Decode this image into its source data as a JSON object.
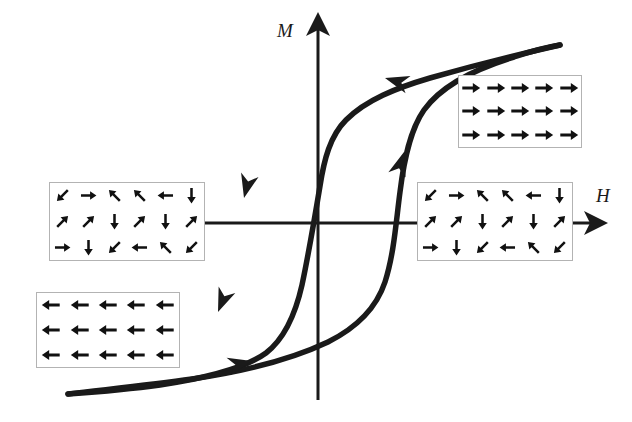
{
  "figure": {
    "type": "hysteresis-loop",
    "background_color": "#ffffff",
    "curve_color": "#1a1a1a",
    "axis_color": "#1a1a1a",
    "box_border_color": "#b3b3b3"
  },
  "axes": {
    "vertical": {
      "label": "M",
      "name": "magnetization-axis",
      "arrow_head": "up",
      "origin_x": 318,
      "top_y": 24,
      "bottom_y": 400
    },
    "horizontal": {
      "label": "H",
      "name": "field-axis",
      "arrow_head": "right",
      "origin_y": 223,
      "left_x": 146,
      "right_x": 596
    }
  },
  "chart_data": {
    "type": "line",
    "title": "",
    "xlabel": "H",
    "ylabel": "M",
    "grid": false,
    "legend": false,
    "series": [
      {
        "name": "descending-branch",
        "direction": "right-to-left",
        "points": [
          [
            560,
            45
          ],
          [
            505,
            58
          ],
          [
            455,
            71
          ],
          [
            410,
            82
          ],
          [
            372,
            96
          ],
          [
            345,
            117
          ],
          [
            330,
            141
          ],
          [
            322,
            168
          ],
          [
            315,
            196
          ],
          [
            308,
            228
          ],
          [
            300,
            265
          ],
          [
            292,
            300
          ],
          [
            282,
            327
          ],
          [
            268,
            348
          ],
          [
            248,
            364
          ],
          [
            222,
            374
          ],
          [
            180,
            381
          ],
          [
            130,
            388
          ],
          [
            68,
            394
          ]
        ]
      },
      {
        "name": "ascending-branch",
        "direction": "left-to-right",
        "points": [
          [
            68,
            394
          ],
          [
            130,
            388
          ],
          [
            180,
            381
          ],
          [
            222,
            374
          ],
          [
            262,
            364
          ],
          [
            300,
            352
          ],
          [
            334,
            338
          ],
          [
            360,
            321
          ],
          [
            378,
            300
          ],
          [
            388,
            272
          ],
          [
            394,
            240
          ],
          [
            400,
            206
          ],
          [
            406,
            170
          ],
          [
            413,
            138
          ],
          [
            424,
            111
          ],
          [
            442,
            90
          ],
          [
            470,
            74
          ],
          [
            510,
            58
          ],
          [
            560,
            45
          ]
        ]
      }
    ],
    "flow_arrows": [
      {
        "name": "upper-branch-arrow",
        "x": 385,
        "y": 78,
        "angle_deg": 196,
        "meaning": "field decreasing along upper saturation branch"
      },
      {
        "name": "descending-steep-arrow",
        "x": 244,
        "y": 198,
        "angle_deg": 104,
        "meaning": "magnetization dropping through coercive field"
      },
      {
        "name": "descending-lower-arrow",
        "x": 218,
        "y": 312,
        "angle_deg": 112,
        "meaning": "approaching negative saturation"
      },
      {
        "name": "lower-branch-arrow",
        "x": 252,
        "y": 361,
        "angle_deg": 347,
        "meaning": "field increasing along lower saturation branch"
      },
      {
        "name": "ascending-steep-arrow",
        "x": 404,
        "y": 152,
        "angle_deg": 287,
        "meaning": "magnetization rising through coercive field"
      }
    ]
  },
  "insets": [
    {
      "id": "box-aligned-right",
      "name": "domain-inset-saturated-positive",
      "state": "saturated-positive",
      "rows": 3,
      "cols": 5,
      "arrows": [
        [
          "right",
          "right",
          "right",
          "right",
          "right"
        ],
        [
          "right",
          "right",
          "right",
          "right",
          "right"
        ],
        [
          "right",
          "right",
          "right",
          "right",
          "right"
        ]
      ]
    },
    {
      "id": "box-aligned-left",
      "name": "domain-inset-saturated-negative",
      "state": "saturated-negative",
      "rows": 3,
      "cols": 5,
      "arrows": [
        [
          "left",
          "left",
          "left",
          "left",
          "left"
        ],
        [
          "left",
          "left",
          "left",
          "left",
          "left"
        ],
        [
          "left",
          "left",
          "left",
          "left",
          "left"
        ]
      ]
    },
    {
      "id": "box-random-left",
      "name": "domain-inset-demagnetized-left",
      "state": "randomly-oriented",
      "rows": 3,
      "cols": 6,
      "arrows": [
        [
          "down-left",
          "right",
          "up-left",
          "up-left",
          "left",
          "down"
        ],
        [
          "up-right",
          "up-right",
          "down",
          "up-right",
          "down",
          "up-right"
        ],
        [
          "right",
          "down",
          "down-left",
          "left",
          "up-left",
          "down-left"
        ]
      ]
    },
    {
      "id": "box-random-right",
      "name": "domain-inset-demagnetized-right",
      "state": "randomly-oriented",
      "rows": 3,
      "cols": 6,
      "arrows": [
        [
          "down-left",
          "right",
          "up-left",
          "up-left",
          "left",
          "down"
        ],
        [
          "up-right",
          "up-right",
          "down",
          "up-right",
          "down",
          "up-right"
        ],
        [
          "right",
          "down",
          "down-left",
          "left",
          "up-left",
          "down-left"
        ]
      ]
    }
  ]
}
